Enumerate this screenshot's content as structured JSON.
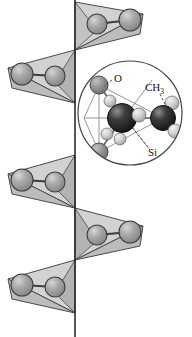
{
  "figure": {
    "name": "polydimethylsiloxane-chain-diagram",
    "background_color": "#ffffff"
  },
  "labels": {
    "oxygen": "O",
    "methyl_element": "CH",
    "methyl_subscript": "3",
    "silicon": "Si"
  },
  "palette": {
    "sphere_fill": "#9b9b9b",
    "sphere_highlight": "#c9c9c9",
    "sphere_stroke": "#3d3d3d",
    "facet_light": "#d2d2d2",
    "facet_mid": "#bcbcbc",
    "facet_dark": "#a3a3a3",
    "outline": "#4a4a4a",
    "axis_line": "#2c2c2c",
    "inset_circle_stroke": "#454545",
    "carbon_dark": "#2b2b2b",
    "carbon_mid": "#5e5e5e",
    "hydrogen_light": "#d9d9d9",
    "oxygen_gray": "#8e8e8e",
    "bond_line": "#6a6a6a",
    "leader_dash": "#3a3a3a"
  },
  "chain": {
    "axis_x": 75,
    "vertices_y": [
      2,
      50,
      103,
      155,
      208,
      260,
      313,
      335
    ],
    "units": [
      {
        "id": "tet-1",
        "direction": "right",
        "apex_y": 50,
        "top_y": 2,
        "spheres": [
          {
            "cx": 97,
            "cy": 24,
            "r": 10
          },
          {
            "cx": 130,
            "cy": 20,
            "r": 11
          }
        ]
      },
      {
        "id": "tet-2",
        "direction": "left",
        "apex_y": 50,
        "top_y": 103,
        "spheres": [
          {
            "cx": 55,
            "cy": 76,
            "r": 10
          },
          {
            "cx": 22,
            "cy": 74,
            "r": 11
          }
        ]
      },
      {
        "id": "tet-3",
        "direction": "left",
        "apex_y": 155,
        "top_y": 208,
        "spheres": [
          {
            "cx": 55,
            "cy": 182,
            "r": 10
          },
          {
            "cx": 22,
            "cy": 180,
            "r": 11
          }
        ]
      },
      {
        "id": "tet-4",
        "direction": "right",
        "apex_y": 208,
        "top_y": 260,
        "spheres": [
          {
            "cx": 97,
            "cy": 235,
            "r": 10
          },
          {
            "cx": 130,
            "cy": 232,
            "r": 11
          }
        ]
      },
      {
        "id": "tet-5",
        "direction": "left",
        "apex_y": 260,
        "top_y": 313,
        "spheres": [
          {
            "cx": 55,
            "cy": 287,
            "r": 10
          },
          {
            "cx": 22,
            "cy": 285,
            "r": 11
          }
        ]
      }
    ]
  },
  "inset": {
    "circle": {
      "cx": 130,
      "cy": 113,
      "r": 52
    },
    "atoms": [
      {
        "id": "o-top",
        "element": "O",
        "cx": 99,
        "cy": 85,
        "r": 9,
        "kind": "oxygen"
      },
      {
        "id": "o-bottom",
        "element": "O",
        "cx": 99,
        "cy": 152,
        "r": 9,
        "kind": "oxygen"
      },
      {
        "id": "si-center",
        "element": "Si",
        "cx": 122,
        "cy": 118,
        "r": 14,
        "kind": "silicon"
      },
      {
        "id": "c-right",
        "element": "C",
        "cx": 163,
        "cy": 118,
        "r": 12,
        "kind": "carbon"
      },
      {
        "id": "h-1",
        "element": "H",
        "cx": 110,
        "cy": 101,
        "r": 6,
        "kind": "hydrogen"
      },
      {
        "id": "h-2",
        "element": "H",
        "cx": 107,
        "cy": 134,
        "r": 6,
        "kind": "hydrogen"
      },
      {
        "id": "h-3",
        "element": "H",
        "cx": 139,
        "cy": 115,
        "r": 7,
        "kind": "hydrogen"
      },
      {
        "id": "h-4",
        "element": "H",
        "cx": 120,
        "cy": 139,
        "r": 6,
        "kind": "hydrogen"
      },
      {
        "id": "h-5",
        "element": "H",
        "cx": 172,
        "cy": 103,
        "r": 7,
        "kind": "hydrogen"
      },
      {
        "id": "h-6",
        "element": "H",
        "cx": 175,
        "cy": 131,
        "r": 7,
        "kind": "hydrogen"
      }
    ],
    "leader_targets": {
      "oxygen": {
        "x1": 112,
        "y1": 80,
        "x2": 104,
        "y2": 86
      },
      "methyl": {
        "x1": 160,
        "y1": 94,
        "x2": 166,
        "y2": 106
      },
      "silicon": {
        "x1": 148,
        "y1": 147,
        "x2": 131,
        "y2": 126
      }
    },
    "label_positions": {
      "oxygen": {
        "x": 114,
        "y": 82
      },
      "methyl": {
        "x": 145,
        "y": 91
      },
      "silicon": {
        "x": 148,
        "y": 156
      }
    }
  }
}
